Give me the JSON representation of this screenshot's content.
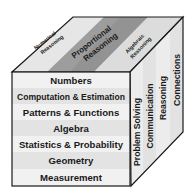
{
  "cube": {
    "top_face": {
      "strips": [
        {
          "lines": [
            "Numerical",
            "Reasoning"
          ]
        },
        {
          "lines": [
            "Proportional",
            "Reasoning"
          ]
        },
        {
          "lines": [
            "Algebraic",
            "Reasoning"
          ]
        }
      ]
    },
    "front_face": {
      "rows": [
        "Numbers",
        "Computation & Estimation",
        "Patterns & Functions",
        "Algebra",
        "Statistics & Probability",
        "Geometry",
        "Measurement"
      ]
    },
    "right_face": {
      "columns": [
        "Problem Solving",
        "Communication",
        "Reasoning",
        "Connections"
      ]
    }
  },
  "colors": {
    "outline": "#1a1a1a",
    "top_light": "#e4e4e4",
    "top_mid": "#b9b9b9",
    "top_dark": "#8f8f8f",
    "front_light": "#f1f1f1",
    "front_alt": "#e2e2e2",
    "side_light": "#ececec",
    "side_alt": "#dedede"
  }
}
